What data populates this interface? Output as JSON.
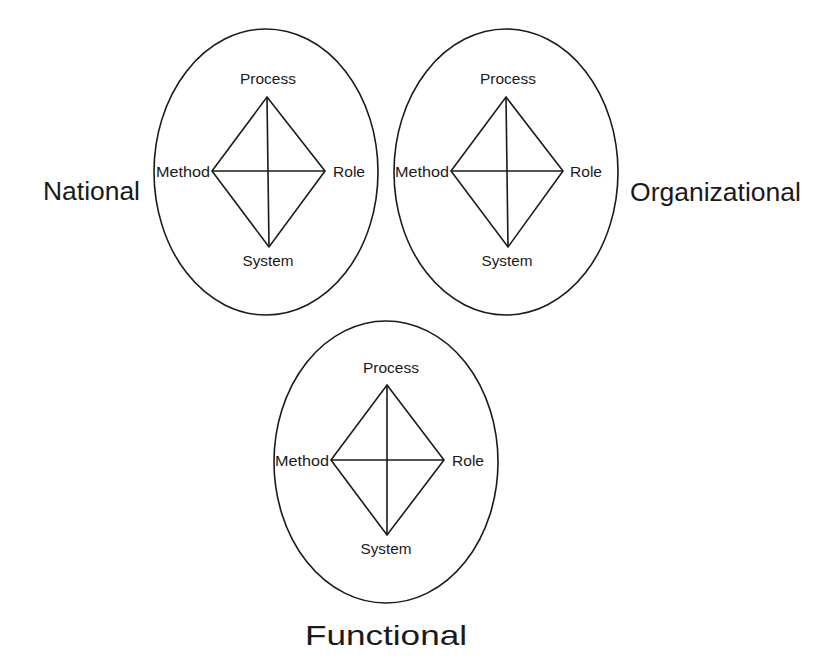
{
  "diagram": {
    "colors": {
      "stroke": "#1a1a1a",
      "background": "#ffffff",
      "text": "#1a1a1a"
    },
    "clusters": [
      {
        "id": "national",
        "level_label": "National",
        "nodes": {
          "top": "Process",
          "left": "Method",
          "right": "Role",
          "bottom": "System"
        }
      },
      {
        "id": "organizational",
        "level_label": "Organizational",
        "nodes": {
          "top": "Process",
          "left": "Method",
          "right": "Role",
          "bottom": "System"
        }
      },
      {
        "id": "functional",
        "level_label": "Functional",
        "nodes": {
          "top": "Process",
          "left": "Method",
          "right": "Role",
          "bottom": "System"
        }
      }
    ]
  }
}
